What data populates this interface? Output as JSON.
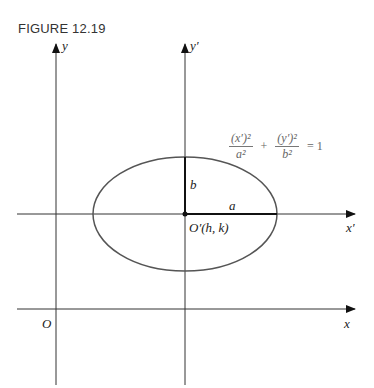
{
  "figure": {
    "title": "FIGURE 12.19"
  },
  "labels": {
    "y_axis": "y",
    "y_prime_axis": "y′",
    "x_axis": "x",
    "x_prime_axis": "x′",
    "origin": "O",
    "translated_origin": "O′(h, k)",
    "semi_major": "a",
    "semi_minor": "b"
  },
  "equation": {
    "term1_num": "(x′)²",
    "term1_den": "a²",
    "plus": "+",
    "term2_num": "(y′)²",
    "term2_den": "b²",
    "equals": "= 1"
  },
  "colors": {
    "axis": "#222222",
    "ellipse": "#555555",
    "equation": "#666666"
  }
}
